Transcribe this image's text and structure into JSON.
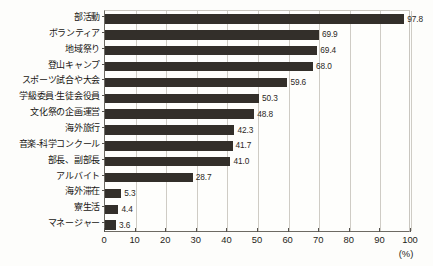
{
  "chart_data": {
    "type": "bar",
    "orientation": "horizontal",
    "title": "",
    "subtitle": "",
    "xlabel": "(%)",
    "ylabel": "",
    "xlim": [
      0,
      100
    ],
    "ylim": null,
    "grid": true,
    "legend": false,
    "legend_position": "none",
    "bar_color": "#332f2a",
    "gridline_color": "#cfccc5",
    "axis_color": "#6d6a63",
    "background_color": "#fefefc",
    "xticks": [
      0,
      10,
      20,
      30,
      40,
      50,
      60,
      70,
      80,
      90,
      100
    ],
    "xtick_labels": [
      "0",
      "10",
      "20",
      "30",
      "40",
      "50",
      "60",
      "70",
      "80",
      "90",
      "100"
    ],
    "unit_label": "(%)",
    "categories": [
      "部活動",
      "ボランティア",
      "地域祭り",
      "登山キャンプ",
      "スポーツ試合や大会",
      "学級委員·生徒会役員",
      "文化祭の企画運営",
      "海外旅行",
      "音楽-科学コンクール",
      "部長、副部長",
      "アルバイト",
      "海外滞在",
      "寮生活",
      "マネージャー"
    ],
    "values": [
      97.8,
      69.9,
      69.4,
      68.0,
      59.6,
      50.3,
      48.8,
      42.3,
      41.7,
      41.0,
      28.7,
      5.3,
      4.4,
      3.6
    ],
    "value_labels": [
      "97.8",
      "69.9",
      "69.4",
      "68.0",
      "59.6",
      "50.3",
      "48.8",
      "42.3",
      "41.7",
      "41.0",
      "28.7",
      "5.3",
      "4.4",
      "3.6"
    ]
  }
}
